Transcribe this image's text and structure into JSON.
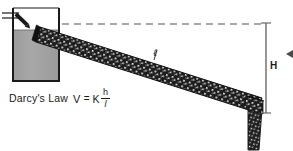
{
  "figure": {
    "title": "Darcy's Law",
    "background_color": "#ffffff"
  },
  "caption": {
    "law_name": "Darcy's Law",
    "formula": {
      "velocity_symbol": "V",
      "equals": "=",
      "conductivity_symbol": "K",
      "numerator": "h",
      "denominator": "l"
    }
  },
  "labels": {
    "head_label": "H",
    "length_label": "ℓ"
  },
  "reservoir": {
    "water_fill_color": "#a3a3a3",
    "outline_color": "#1a1a1a",
    "x": 12,
    "y": 8,
    "width": 48,
    "height": 73
  },
  "tube": {
    "fill_color": "#1c1c1c",
    "speckle_color": "#f2f2f2",
    "start_x": 40,
    "start_y": 27,
    "end_x": 262,
    "end_y": 100,
    "thickness": 15,
    "outlet_bend_x": 258,
    "outlet_bottom_y": 148
  },
  "datum_line": {
    "style": "dashed",
    "color": "#555555",
    "y": 24,
    "x_start": 62,
    "x_end": 266
  },
  "dimension_line_h": {
    "color": "#6a6a6a",
    "x": 266,
    "y_top": 23,
    "y_bottom": 113
  },
  "inflow_arrow": {
    "color": "#1a1a1a",
    "description": "water inflow arrow entering reservoir from upper left"
  },
  "edge_marker": {
    "color": "#4a4a4a",
    "description": "cropped arrowhead at right edge"
  }
}
